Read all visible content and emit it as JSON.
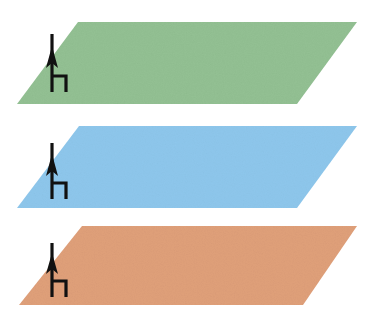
{
  "figure": {
    "title": "Three stacked parallelogram planes with vertical arrow markers",
    "background_color": "#ffffff",
    "width": 377,
    "height": 335,
    "layers": [
      {
        "id": "layer-green",
        "label": "green-plane",
        "fill_color": "#93c193",
        "order": 1,
        "position": "top",
        "geometry": {
          "top_left_x": 78,
          "top_y": 22,
          "top_right_x": 357,
          "bottom_left_x": 17,
          "bottom_y": 104,
          "bottom_right_x": 297
        },
        "marker": {
          "name": "up-arrow-with-h-symbol",
          "x": 52,
          "top_y": 34,
          "bottom_y": 92,
          "color": "#111111"
        }
      },
      {
        "id": "layer-blue",
        "label": "blue-plane",
        "fill_color": "#8ec7ec",
        "order": 2,
        "position": "middle",
        "geometry": {
          "top_left_x": 79,
          "top_y": 126,
          "top_right_x": 357,
          "bottom_left_x": 17,
          "bottom_y": 208,
          "bottom_right_x": 297
        },
        "marker": {
          "name": "up-arrow-with-h-symbol",
          "x": 52,
          "top_y": 143,
          "bottom_y": 199,
          "color": "#111111"
        }
      },
      {
        "id": "layer-salmon",
        "label": "salmon-plane",
        "fill_color": "#e0a07a",
        "order": 3,
        "position": "bottom",
        "geometry": {
          "top_left_x": 82,
          "top_y": 226,
          "top_right_x": 357,
          "bottom_left_x": 19,
          "bottom_y": 305,
          "bottom_right_x": 303
        },
        "marker": {
          "name": "up-arrow-with-h-symbol",
          "x": 52,
          "top_y": 243,
          "bottom_y": 297,
          "color": "#111111"
        }
      }
    ],
    "marker_legend": {
      "symbol_name": "antenna-arrow-marker",
      "description": "vertical shaft with upward arrowhead and small h-shaped hook at base"
    }
  }
}
